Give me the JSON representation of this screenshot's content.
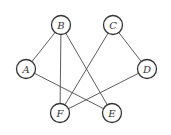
{
  "graph": {
    "nodes": [
      {
        "id": "A",
        "label": "A",
        "x": 26,
        "y": 69
      },
      {
        "id": "B",
        "label": "B",
        "x": 61,
        "y": 25
      },
      {
        "id": "C",
        "label": "C",
        "x": 113,
        "y": 25
      },
      {
        "id": "D",
        "label": "D",
        "x": 147,
        "y": 69
      },
      {
        "id": "F",
        "label": "F",
        "x": 60,
        "y": 113
      },
      {
        "id": "E",
        "label": "E",
        "x": 112,
        "y": 113
      }
    ],
    "edges": [
      [
        "A",
        "B"
      ],
      [
        "A",
        "E"
      ],
      [
        "B",
        "F"
      ],
      [
        "B",
        "E"
      ],
      [
        "C",
        "F"
      ],
      [
        "C",
        "D"
      ],
      [
        "D",
        "F"
      ]
    ],
    "node_radius": 9.5
  }
}
